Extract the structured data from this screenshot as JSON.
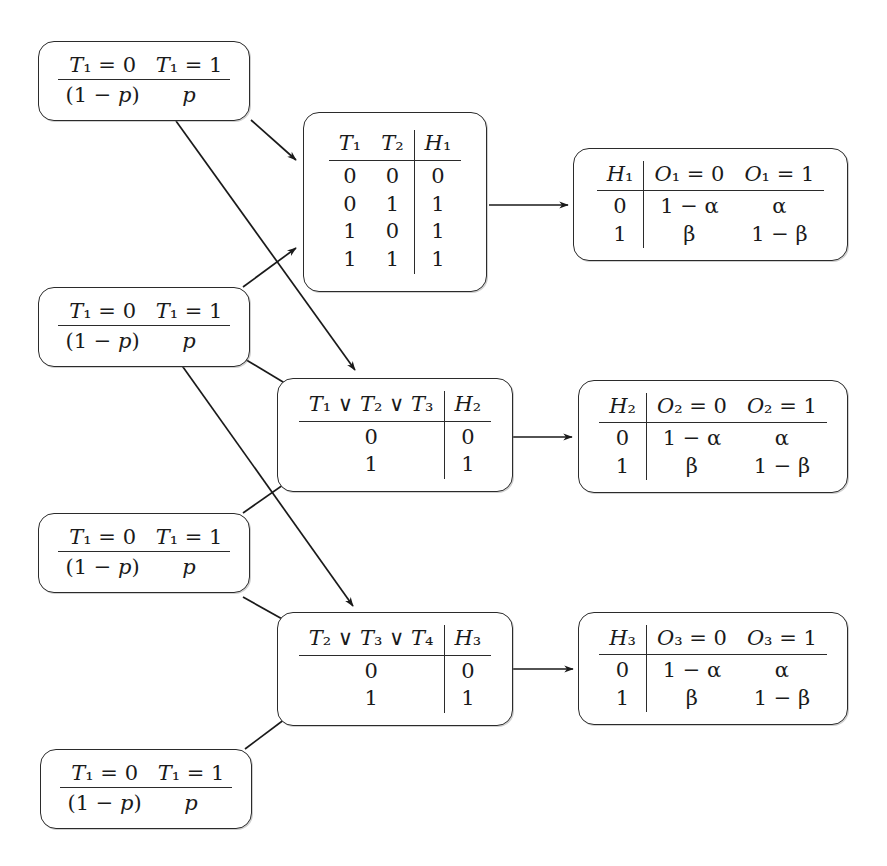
{
  "diagram": {
    "type": "bayesian-network-cpt-diagram",
    "ink_color": "#1a1a1a",
    "background": "#ffffff"
  },
  "symbols": {
    "or": "∨",
    "alpha": "α",
    "beta": "β",
    "arrow": "→"
  },
  "priors": [
    {
      "id": "prior-1",
      "headers": [
        "T₁ = 0",
        "T₁ = 1"
      ],
      "values": [
        "(1 − p)",
        "p"
      ],
      "var": "T1"
    },
    {
      "id": "prior-2",
      "headers": [
        "T₁ = 0",
        "T₁ = 1"
      ],
      "values": [
        "(1 − p)",
        "p"
      ],
      "var": "T1"
    },
    {
      "id": "prior-3",
      "headers": [
        "T₁ = 0",
        "T₁ = 1"
      ],
      "values": [
        "(1 − p)",
        "p"
      ],
      "var": "T1"
    },
    {
      "id": "prior-4",
      "headers": [
        "T₁ = 0",
        "T₁ = 1"
      ],
      "values": [
        "(1 − p)",
        "p"
      ],
      "var": "T1"
    }
  ],
  "hidden_tables": [
    {
      "id": "h1-table",
      "headers": [
        "T₁",
        "T₂",
        "H₁"
      ],
      "parent_count": 2,
      "rows": [
        [
          "0",
          "0",
          "0"
        ],
        [
          "0",
          "1",
          "1"
        ],
        [
          "1",
          "0",
          "1"
        ],
        [
          "1",
          "1",
          "1"
        ]
      ]
    },
    {
      "id": "h2-table",
      "headers": [
        "T₁ ∨ T₂ ∨ T₃",
        "H₂"
      ],
      "parent_count": 1,
      "rows": [
        [
          "0",
          "0"
        ],
        [
          "1",
          "1"
        ]
      ]
    },
    {
      "id": "h3-table",
      "headers": [
        "T₂ ∨ T₃ ∨ T₄",
        "H₃"
      ],
      "parent_count": 1,
      "rows": [
        [
          "0",
          "0"
        ],
        [
          "1",
          "1"
        ]
      ]
    }
  ],
  "observation_tables": [
    {
      "id": "o1-table",
      "headers": [
        "H₁",
        "O₁ = 0",
        "O₁ = 1"
      ],
      "rows": [
        [
          "0",
          "1 − α",
          "α"
        ],
        [
          "1",
          "β",
          "1 − β"
        ]
      ]
    },
    {
      "id": "o2-table",
      "headers": [
        "H₂",
        "O₂ = 0",
        "O₂ = 1"
      ],
      "rows": [
        [
          "0",
          "1 − α",
          "α"
        ],
        [
          "1",
          "β",
          "1 − β"
        ]
      ]
    },
    {
      "id": "o3-table",
      "headers": [
        "H₃",
        "O₃ = 0",
        "O₃ = 1"
      ],
      "rows": [
        [
          "0",
          "1 − α",
          "α"
        ],
        [
          "1",
          "β",
          "1 − β"
        ]
      ]
    }
  ],
  "edges": [
    {
      "id": "edge-prior1-h1",
      "from": "prior-1",
      "to": "h1-table",
      "kind": "diagonal"
    },
    {
      "id": "edge-prior1-h2",
      "from": "prior-1",
      "to": "h2-table",
      "kind": "long-diagonal"
    },
    {
      "id": "edge-prior2-h1",
      "from": "prior-2",
      "to": "h1-table",
      "kind": "diagonal-up"
    },
    {
      "id": "edge-prior2-h2",
      "from": "prior-2",
      "to": "h2-table",
      "kind": "diagonal"
    },
    {
      "id": "edge-prior3-h2",
      "from": "prior-3",
      "to": "h2-table",
      "kind": "diagonal-up"
    },
    {
      "id": "edge-prior3-h3",
      "from": "prior-3",
      "to": "h3-table",
      "kind": "diagonal"
    },
    {
      "id": "edge-prior2-h3",
      "from": "prior-2",
      "to": "h3-table",
      "kind": "long-diagonal"
    },
    {
      "id": "edge-prior4-h3",
      "from": "prior-4",
      "to": "h3-table",
      "kind": "diagonal-up"
    },
    {
      "id": "edge-h1-o1",
      "from": "h1-table",
      "to": "o1-table",
      "kind": "horizontal"
    },
    {
      "id": "edge-h2-o2",
      "from": "h2-table",
      "to": "o2-table",
      "kind": "horizontal"
    },
    {
      "id": "edge-h3-o3",
      "from": "h3-table",
      "to": "o3-table",
      "kind": "horizontal"
    }
  ]
}
